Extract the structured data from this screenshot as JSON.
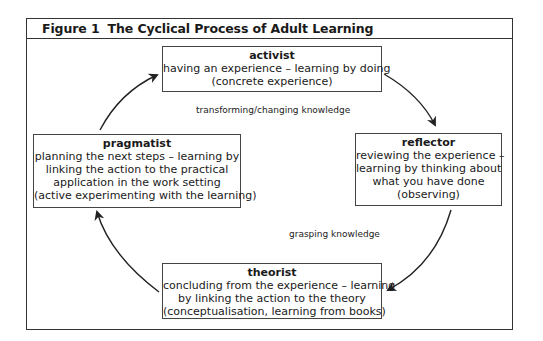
{
  "figure": {
    "number": "Figure 1",
    "title": "The Cyclical Process of Adult Learning"
  },
  "stages": {
    "activist": {
      "role": "activist",
      "lines": [
        "having an experience – learning by doing",
        "(concrete experience)"
      ]
    },
    "reflector": {
      "role": "reflector",
      "lines": [
        "reviewing the experience –",
        "learning by thinking about",
        "what you have done",
        "(observing)"
      ]
    },
    "theorist": {
      "role": "theorist",
      "lines": [
        "concluding from the experience – learning",
        "by linking the action to the theory",
        "(conceptualisation, learning from books)"
      ]
    },
    "pragmatist": {
      "role": "pragmatist",
      "lines": [
        "planning the next steps – learning by",
        "linking the action to the practical",
        "application in the work setting",
        "(active experimenting with the learning)"
      ]
    }
  },
  "axis_labels": {
    "top": "transforming/changing knowledge",
    "bottom": "grasping knowledge"
  },
  "cycle_order": [
    "activist",
    "reflector",
    "theorist",
    "pragmatist"
  ],
  "colors": {
    "line": "#333333",
    "text": "#1a1a1a",
    "background": "#ffffff"
  }
}
